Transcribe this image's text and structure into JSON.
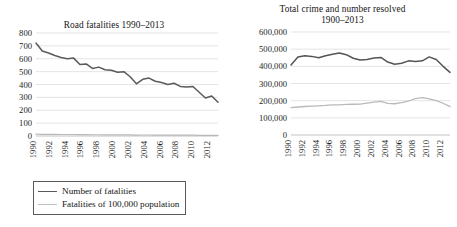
{
  "figure": {
    "background": "#ffffff",
    "panels": [
      "road-fatalities",
      "total-crime"
    ]
  },
  "chart_data": [
    {
      "id": "road-fatalities",
      "type": "line",
      "title": "Road fatalities 1990–2013",
      "xlabel": "",
      "ylabel": "",
      "ylim": [
        0,
        800
      ],
      "ytick_step": 100,
      "grid": true,
      "legend_position": "below",
      "ytick_labels": [
        "800",
        "700",
        "600",
        "500",
        "400",
        "300",
        "200",
        "100",
        "0"
      ],
      "x": [
        1990,
        1991,
        1992,
        1993,
        1994,
        1995,
        1996,
        1997,
        1998,
        1999,
        2000,
        2001,
        2002,
        2003,
        2004,
        2005,
        2006,
        2007,
        2008,
        2009,
        2010,
        2011,
        2012,
        2013
      ],
      "xtick_labels": [
        "1990",
        "1992",
        "1994",
        "1996",
        "1998",
        "2000",
        "2002",
        "2004",
        "2006",
        "2008",
        "2010",
        "2012"
      ],
      "series": [
        {
          "name": "Number of fatalities",
          "color": "#5a5a5a",
          "width": 1.5,
          "values": [
            722,
            660,
            645,
            625,
            610,
            600,
            605,
            555,
            560,
            525,
            535,
            515,
            510,
            495,
            500,
            460,
            405,
            440,
            450,
            425,
            415,
            400,
            410,
            385,
            380,
            385,
            340,
            295,
            310,
            262
          ]
        },
        {
          "name": "Fatalities of 100,000 population",
          "color": "#b9b9b9",
          "width": 1.2,
          "values": [
            14,
            13,
            12.6,
            12.2,
            11.8,
            11.5,
            11.5,
            10.5,
            10.5,
            9.8,
            9.9,
            9.5,
            9.4,
            9.0,
            9.0,
            8.3,
            7.2,
            7.8,
            7.9,
            7.4,
            7.2,
            6.9,
            7.0,
            6.5,
            6.4,
            6.4,
            5.6,
            4.8,
            5.0,
            4.2
          ]
        }
      ]
    },
    {
      "id": "total-crime",
      "type": "line",
      "title_line1": "Total crime and number resolved",
      "title_line2": "1900–2013",
      "xlabel": "",
      "ylabel": "",
      "ylim": [
        0,
        600000
      ],
      "ytick_step": 100000,
      "grid": true,
      "legend_position": "below",
      "ytick_labels": [
        "600,000",
        "500,000",
        "400,000",
        "300,000",
        "200,000",
        "100,000",
        "0"
      ],
      "x": [
        1990,
        1991,
        1992,
        1993,
        1994,
        1995,
        1996,
        1997,
        1998,
        1999,
        2000,
        2001,
        2002,
        2003,
        2004,
        2005,
        2006,
        2007,
        2008,
        2009,
        2010,
        2011,
        2012,
        2013
      ],
      "xtick_labels": [
        "1990",
        "1992",
        "1994",
        "1996",
        "1998",
        "2000",
        "2002",
        "2004",
        "2006",
        "2008",
        "2010",
        "2012"
      ],
      "series": [
        {
          "name": "Recorded",
          "color": "#555555",
          "width": 1.5,
          "values": [
            408000,
            455000,
            462000,
            458000,
            450000,
            462000,
            470000,
            478000,
            468000,
            447000,
            437000,
            440000,
            448000,
            452000,
            425000,
            412000,
            418000,
            432000,
            428000,
            432000,
            455000,
            440000,
            400000,
            365000
          ]
        },
        {
          "name": "Resolved",
          "color": "#b9b9b9",
          "width": 1.3,
          "values": [
            160000,
            163000,
            166000,
            168000,
            170000,
            172000,
            175000,
            176000,
            178000,
            179000,
            180000,
            186000,
            192000,
            196000,
            184000,
            182000,
            188000,
            198000,
            212000,
            218000,
            210000,
            200000,
            185000,
            165000
          ]
        }
      ]
    }
  ],
  "legends": {
    "left": {
      "items": [
        {
          "label": "Number of fatalities",
          "color": "#5a5a5a",
          "thickness": "1.6px"
        },
        {
          "label": "Fatalities of 100,000 population",
          "color": "#bdbdbd",
          "thickness": "1.2px"
        }
      ]
    },
    "right": {
      "items": [
        {
          "label": "Recorded",
          "color": "#555555",
          "thickness": "1.6px"
        },
        {
          "label": "Resolved",
          "color": "#bdbdbd",
          "thickness": "1.2px"
        }
      ]
    }
  }
}
